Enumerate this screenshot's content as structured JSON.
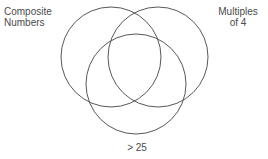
{
  "diagram": {
    "type": "venn-3-circle",
    "background_color": "#ffffff",
    "stroke_color": "#58585a",
    "text_color": "#4a4a4c",
    "sets": [
      {
        "id": "composite-numbers",
        "label": "Composite\nNumbers",
        "label_position": "top-left",
        "cx": 111,
        "cy": 57,
        "r": 50
      },
      {
        "id": "multiples-of-4",
        "label": "Multiples\nof 4",
        "label_position": "top-right",
        "cx": 158,
        "cy": 57,
        "r": 50
      },
      {
        "id": "greater-than-25",
        "label": "> 25",
        "label_position": "bottom-center",
        "cx": 136,
        "cy": 84,
        "r": 50
      }
    ]
  }
}
